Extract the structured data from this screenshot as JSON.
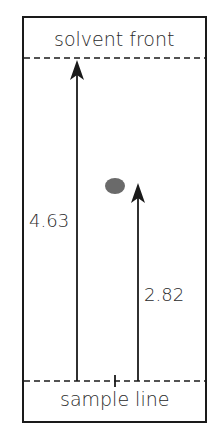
{
  "diagram": {
    "title": "",
    "labels": {
      "solvent_front": "solvent front",
      "sample_line": "sample line",
      "solvent_distance": "4.63",
      "spot_distance": "2.82"
    },
    "colors": {
      "line": "#1a1a1a",
      "spot": "#6a6a6a",
      "text": "#2a2a2a"
    }
  }
}
